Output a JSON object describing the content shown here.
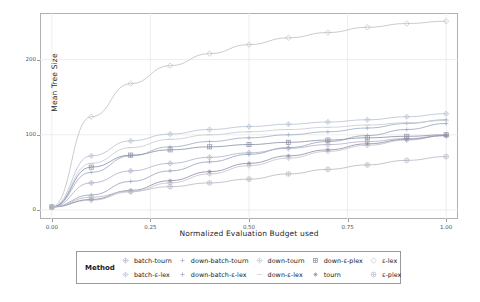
{
  "chart_data": {
    "type": "line",
    "title": "",
    "xlabel": "Normalized Evaluation Budget used",
    "ylabel": "Mean Tree Size",
    "xlim": [
      -0.03,
      1.03
    ],
    "ylim": [
      -12,
      262
    ],
    "xticks": [
      "0.00",
      "0.25",
      "0.50",
      "0.75",
      "1.00"
    ],
    "xtick_values": [
      0.0,
      0.25,
      0.5,
      0.75,
      1.0
    ],
    "yticks": [
      "0",
      "100",
      "200"
    ],
    "ytick_values": [
      0,
      100,
      200
    ],
    "grid": true,
    "legend_position": "bottom",
    "legend_title": "Method",
    "x": [
      0.0,
      0.1,
      0.2,
      0.3,
      0.4,
      0.5,
      0.6,
      0.7,
      0.8,
      0.9,
      1.0
    ],
    "series": [
      {
        "name": "batch-tourn",
        "color": "#b3b3cc",
        "marker": "diamond-plus",
        "values": [
          4,
          36,
          52,
          62,
          70,
          76,
          82,
          87,
          91,
          95,
          99
        ]
      },
      {
        "name": "batch-ε-lex",
        "color": "#b9c4d6",
        "marker": "diamond-plus",
        "values": [
          4,
          72,
          92,
          101,
          107,
          111,
          114,
          117,
          120,
          124,
          128
        ]
      },
      {
        "name": "down-batch-tourn",
        "color": "#9fb0c4",
        "marker": "plus",
        "values": [
          4,
          50,
          72,
          84,
          91,
          96,
          100,
          104,
          109,
          115,
          120
        ]
      },
      {
        "name": "down-batch-ε-lex",
        "color": "#9aa8bd",
        "marker": "plus",
        "values": [
          4,
          20,
          38,
          52,
          64,
          74,
          83,
          91,
          99,
          107,
          115
        ]
      },
      {
        "name": "down-tourn",
        "color": "#c0c8d0",
        "marker": "diamond",
        "values": [
          4,
          13,
          24,
          36,
          48,
          59,
          69,
          78,
          86,
          93,
          99
        ]
      },
      {
        "name": "down-ε-lex",
        "color": "#c9ccd4",
        "marker": "dash",
        "values": [
          4,
          62,
          83,
          94,
          100,
          104,
          107,
          110,
          113,
          116,
          119
        ]
      },
      {
        "name": "down-ε-plex",
        "color": "#8f95a8",
        "marker": "square-plus",
        "values": [
          4,
          57,
          73,
          80,
          84,
          87,
          90,
          93,
          96,
          98,
          100
        ]
      },
      {
        "name": "tourn",
        "color": "#9b8fa8",
        "marker": "star",
        "values": [
          4,
          14,
          26,
          39,
          51,
          62,
          72,
          80,
          88,
          94,
          99
        ]
      },
      {
        "name": "ε-lex",
        "color": "#c2c2c2",
        "marker": "diamond-open",
        "values": [
          4,
          124,
          168,
          192,
          208,
          220,
          229,
          236,
          243,
          248,
          251
        ]
      },
      {
        "name": "ε-plex",
        "color": "#b7bcc4",
        "marker": "circle-plus",
        "values": [
          4,
          17,
          25,
          31,
          36,
          41,
          48,
          54,
          60,
          66,
          71
        ]
      }
    ]
  },
  "legend": {
    "title": "Method",
    "items": [
      {
        "label": "batch-tourn"
      },
      {
        "label": "down-batch-tourn"
      },
      {
        "label": "down-tourn"
      },
      {
        "label": "down-ε-plex"
      },
      {
        "label": "ε-lex"
      },
      {
        "label": "batch-ε-lex"
      },
      {
        "label": "down-batch-ε-lex"
      },
      {
        "label": "down-ε-lex"
      },
      {
        "label": "tourn"
      },
      {
        "label": "ε-plex"
      }
    ]
  },
  "colors": {
    "frame": "#b0b0b0",
    "grid": "#e9e9e9",
    "text": "#1f1f1f",
    "tick_text": "#555555"
  }
}
